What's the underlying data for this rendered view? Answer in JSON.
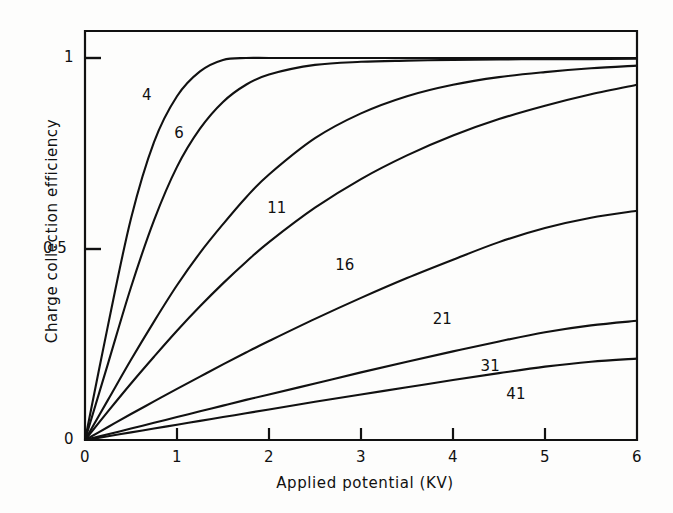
{
  "chart_data": {
    "type": "line",
    "title": "",
    "xlabel": "Applied potential (KV)",
    "ylabel": "Charge collection efficiency",
    "xlim": [
      0,
      6
    ],
    "ylim": [
      0,
      1.09
    ],
    "grid": false,
    "legend": "inline-curve-labels",
    "xticks": [
      {
        "value": 0,
        "label": "0"
      },
      {
        "value": 1,
        "label": "1"
      },
      {
        "value": 2,
        "label": "2"
      },
      {
        "value": 3,
        "label": "3"
      },
      {
        "value": 4,
        "label": "4"
      },
      {
        "value": 5,
        "label": "5"
      },
      {
        "value": 6,
        "label": "6"
      }
    ],
    "yticks": [
      {
        "value": 0,
        "label": "0"
      },
      {
        "value": 0.5,
        "label": "0·5"
      },
      {
        "value": 1,
        "label": "1"
      }
    ],
    "x": [
      0,
      0.25,
      0.5,
      0.75,
      1,
      1.25,
      1.5,
      1.75,
      2,
      2.5,
      3,
      3.5,
      4,
      4.5,
      5,
      5.5,
      6
    ],
    "series": [
      {
        "name": "4",
        "label": "4",
        "label_x": 0.62,
        "label_y": 0.9,
        "values": [
          0,
          0.3,
          0.58,
          0.78,
          0.9,
          0.965,
          0.995,
          1.0,
          1.0,
          1.0,
          1.0,
          1.0,
          1.0,
          1.0,
          1.0,
          1.0,
          1.0
        ]
      },
      {
        "name": "6",
        "label": "6",
        "label_x": 0.97,
        "label_y": 0.8,
        "values": [
          0,
          0.2,
          0.4,
          0.575,
          0.715,
          0.815,
          0.885,
          0.93,
          0.957,
          0.982,
          0.99,
          0.993,
          0.995,
          0.996,
          0.997,
          0.997,
          0.998
        ]
      },
      {
        "name": "11",
        "label": "11",
        "label_x": 1.98,
        "label_y": 0.605,
        "values": [
          0,
          0.105,
          0.21,
          0.31,
          0.405,
          0.49,
          0.565,
          0.635,
          0.695,
          0.79,
          0.855,
          0.9,
          0.93,
          0.95,
          0.963,
          0.973,
          0.98
        ]
      },
      {
        "name": "16",
        "label": "16",
        "label_x": 2.72,
        "label_y": 0.455,
        "values": [
          0,
          0.075,
          0.148,
          0.218,
          0.286,
          0.35,
          0.41,
          0.466,
          0.518,
          0.608,
          0.683,
          0.745,
          0.797,
          0.84,
          0.875,
          0.905,
          0.93
        ]
      },
      {
        "name": "21",
        "label": "21",
        "label_x": 3.78,
        "label_y": 0.315,
        "values": [
          0,
          0.034,
          0.068,
          0.101,
          0.134,
          0.166,
          0.198,
          0.229,
          0.259,
          0.317,
          0.372,
          0.424,
          0.472,
          0.518,
          0.555,
          0.582,
          0.6
        ]
      },
      {
        "name": "31",
        "label": "31",
        "label_x": 4.3,
        "label_y": 0.19,
        "values": [
          0,
          0.015,
          0.03,
          0.045,
          0.06,
          0.075,
          0.09,
          0.105,
          0.119,
          0.148,
          0.177,
          0.205,
          0.232,
          0.258,
          0.282,
          0.3,
          0.312
        ]
      },
      {
        "name": "41",
        "label": "41",
        "label_x": 4.58,
        "label_y": 0.118,
        "values": [
          0,
          0.01,
          0.02,
          0.03,
          0.04,
          0.05,
          0.06,
          0.07,
          0.08,
          0.1,
          0.119,
          0.138,
          0.157,
          0.175,
          0.192,
          0.205,
          0.213
        ]
      }
    ]
  },
  "axes": {
    "x_title": "Applied potential (KV)",
    "y_title": "Charge collection efficiency"
  },
  "ticks": {
    "x": [
      "0",
      "1",
      "2",
      "3",
      "4",
      "5",
      "6"
    ],
    "y": [
      "0",
      "0·5",
      "1"
    ]
  },
  "curve_labels": [
    "4",
    "6",
    "11",
    "16",
    "21",
    "31",
    "41"
  ],
  "colors": {
    "ink": "#111111",
    "background": "#fdfdfc"
  }
}
